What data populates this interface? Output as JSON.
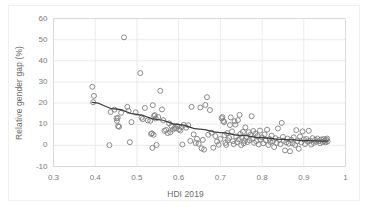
{
  "chart_data": {
    "type": "scatter",
    "title": "",
    "xlabel": "HDI 2019",
    "ylabel": "Relative gender gap (%)",
    "xlim": [
      0.3,
      1.0
    ],
    "ylim": [
      -10,
      60
    ],
    "xticks": [
      "0.3",
      "0.4",
      "0.5",
      "0.6",
      "0.7",
      "0.8",
      "0.9",
      "1"
    ],
    "xtick_values": [
      0.3,
      0.4,
      0.5,
      0.6,
      0.7,
      0.8,
      0.9,
      1.0
    ],
    "yticks": [
      "-10",
      "0",
      "10",
      "20",
      "30",
      "40",
      "50",
      "60"
    ],
    "ytick_values": [
      -10,
      0,
      10,
      20,
      30,
      40,
      50,
      60
    ],
    "grid": "horizontal-and-vertical",
    "legend": "none",
    "marker": "open-circle",
    "marker_color": "#7f7f7f",
    "trendline_color": "#404040",
    "series": [
      {
        "name": "Countries",
        "points": [
          [
            0.393,
            27.7
          ],
          [
            0.397,
            23.4
          ],
          [
            0.395,
            20.4
          ],
          [
            0.434,
            0.1
          ],
          [
            0.437,
            15.8
          ],
          [
            0.446,
            16.9
          ],
          [
            0.451,
            12.8
          ],
          [
            0.452,
            11.6
          ],
          [
            0.454,
            13.0
          ],
          [
            0.455,
            9.1
          ],
          [
            0.457,
            8.8
          ],
          [
            0.462,
            15.4
          ],
          [
            0.469,
            51.1
          ],
          [
            0.477,
            18.2
          ],
          [
            0.48,
            16.3
          ],
          [
            0.483,
            1.5
          ],
          [
            0.487,
            11.0
          ],
          [
            0.497,
            15.6
          ],
          [
            0.508,
            34.2
          ],
          [
            0.511,
            13.1
          ],
          [
            0.514,
            12.4
          ],
          [
            0.519,
            17.7
          ],
          [
            0.526,
            11.8
          ],
          [
            0.532,
            11.6
          ],
          [
            0.534,
            5.4
          ],
          [
            0.536,
            5.7
          ],
          [
            0.537,
            -1.2
          ],
          [
            0.538,
            19.0
          ],
          [
            0.54,
            5.0
          ],
          [
            0.541,
            13.9
          ],
          [
            0.543,
            14.3
          ],
          [
            0.545,
            12.7
          ],
          [
            0.547,
            0.2
          ],
          [
            0.551,
            13.4
          ],
          [
            0.556,
            25.8
          ],
          [
            0.56,
            17.0
          ],
          [
            0.563,
            11.9
          ],
          [
            0.566,
            6.9
          ],
          [
            0.57,
            7.3
          ],
          [
            0.574,
            5.8
          ],
          [
            0.577,
            10.4
          ],
          [
            0.58,
            6.2
          ],
          [
            0.583,
            9.0
          ],
          [
            0.586,
            7.4
          ],
          [
            0.59,
            8.2
          ],
          [
            0.594,
            8.0
          ],
          [
            0.597,
            9.2
          ],
          [
            0.601,
            7.6
          ],
          [
            0.604,
            7.0
          ],
          [
            0.607,
            8.6
          ],
          [
            0.609,
            0.4
          ],
          [
            0.612,
            9.7
          ],
          [
            0.618,
            8.4
          ],
          [
            0.623,
            9.5
          ],
          [
            0.628,
            2.1
          ],
          [
            0.631,
            18.2
          ],
          [
            0.636,
            5.2
          ],
          [
            0.641,
            1.1
          ],
          [
            0.644,
            3.1
          ],
          [
            0.648,
            0.7
          ],
          [
            0.652,
            17.9
          ],
          [
            0.655,
            -1.4
          ],
          [
            0.658,
            2.6
          ],
          [
            0.661,
            -2.0
          ],
          [
            0.664,
            19.1
          ],
          [
            0.668,
            22.8
          ],
          [
            0.671,
            5.0
          ],
          [
            0.675,
            16.7
          ],
          [
            0.679,
            6.0
          ],
          [
            0.683,
            -1.1
          ],
          [
            0.688,
            4.4
          ],
          [
            0.692,
            1.8
          ],
          [
            0.696,
            0.3
          ],
          [
            0.7,
            3.0
          ],
          [
            0.703,
            12.8
          ],
          [
            0.705,
            13.4
          ],
          [
            0.707,
            11.5
          ],
          [
            0.709,
            11.0
          ],
          [
            0.71,
            4.8
          ],
          [
            0.712,
            1.2
          ],
          [
            0.714,
            0.2
          ],
          [
            0.716,
            5.8
          ],
          [
            0.718,
            2.4
          ],
          [
            0.721,
            3.5
          ],
          [
            0.723,
            9.6
          ],
          [
            0.725,
            13.2
          ],
          [
            0.728,
            6.6
          ],
          [
            0.73,
            2.0
          ],
          [
            0.732,
            0.6
          ],
          [
            0.734,
            11.4
          ],
          [
            0.736,
            9.8
          ],
          [
            0.738,
            4.2
          ],
          [
            0.74,
            1.5
          ],
          [
            0.742,
            11.9
          ],
          [
            0.744,
            2.8
          ],
          [
            0.746,
            14.4
          ],
          [
            0.748,
            5.4
          ],
          [
            0.75,
            0.1
          ],
          [
            0.752,
            3.6
          ],
          [
            0.754,
            6.4
          ],
          [
            0.756,
            1.0
          ],
          [
            0.758,
            2.2
          ],
          [
            0.76,
            8.5
          ],
          [
            0.762,
            4.0
          ],
          [
            0.765,
            1.6
          ],
          [
            0.768,
            6.2
          ],
          [
            0.77,
            2.4
          ],
          [
            0.772,
            5.0
          ],
          [
            0.775,
            13.8
          ],
          [
            0.777,
            3.2
          ],
          [
            0.779,
            6.8
          ],
          [
            0.781,
            1.2
          ],
          [
            0.784,
            5.6
          ],
          [
            0.786,
            2.0
          ],
          [
            0.789,
            4.4
          ],
          [
            0.792,
            0.4
          ],
          [
            0.795,
            7.0
          ],
          [
            0.797,
            2.8
          ],
          [
            0.8,
            3.8
          ],
          [
            0.803,
            1.0
          ],
          [
            0.806,
            5.2
          ],
          [
            0.809,
            2.4
          ],
          [
            0.812,
            7.4
          ],
          [
            0.815,
            0.2
          ],
          [
            0.818,
            3.0
          ],
          [
            0.82,
            1.6
          ],
          [
            0.823,
            4.6
          ],
          [
            0.826,
            2.0
          ],
          [
            0.829,
            -0.8
          ],
          [
            0.832,
            3.4
          ],
          [
            0.835,
            1.2
          ],
          [
            0.838,
            8.0
          ],
          [
            0.841,
            2.6
          ],
          [
            0.844,
            0.6
          ],
          [
            0.847,
            10.6
          ],
          [
            0.85,
            4.0
          ],
          [
            0.852,
            2.2
          ],
          [
            0.855,
            -2.4
          ],
          [
            0.858,
            1.4
          ],
          [
            0.861,
            3.2
          ],
          [
            0.864,
            0.8
          ],
          [
            0.867,
            -2.8
          ],
          [
            0.87,
            2.6
          ],
          [
            0.873,
            1.0
          ],
          [
            0.876,
            3.8
          ],
          [
            0.879,
            0.2
          ],
          [
            0.882,
            7.2
          ],
          [
            0.885,
            2.0
          ],
          [
            0.888,
            -1.6
          ],
          [
            0.891,
            4.2
          ],
          [
            0.894,
            1.4
          ],
          [
            0.897,
            6.6
          ],
          [
            0.9,
            2.8
          ],
          [
            0.903,
            0.6
          ],
          [
            0.906,
            3.0
          ],
          [
            0.909,
            1.8
          ],
          [
            0.912,
            6.9
          ],
          [
            0.915,
            2.2
          ],
          [
            0.918,
            0.4
          ],
          [
            0.921,
            3.4
          ],
          [
            0.924,
            1.2
          ],
          [
            0.927,
            2.6
          ],
          [
            0.93,
            1.8
          ],
          [
            0.933,
            3.2
          ],
          [
            0.936,
            2.0
          ],
          [
            0.939,
            1.0
          ],
          [
            0.942,
            2.8
          ],
          [
            0.945,
            1.6
          ],
          [
            0.948,
            3.0
          ],
          [
            0.95,
            2.2
          ],
          [
            0.952,
            1.4
          ],
          [
            0.954,
            2.6
          ],
          [
            0.956,
            3.2
          ],
          [
            0.957,
            1.8
          ]
        ]
      }
    ],
    "trendline": {
      "name": "Fitted trend",
      "points": [
        [
          0.393,
          20.3
        ],
        [
          0.45,
          17.2
        ],
        [
          0.5,
          14.6
        ],
        [
          0.55,
          12.2
        ],
        [
          0.6,
          9.8
        ],
        [
          0.65,
          7.7
        ],
        [
          0.7,
          6.0
        ],
        [
          0.75,
          4.7
        ],
        [
          0.8,
          3.6
        ],
        [
          0.85,
          2.8
        ],
        [
          0.9,
          2.3
        ],
        [
          0.957,
          2.0
        ]
      ]
    }
  }
}
